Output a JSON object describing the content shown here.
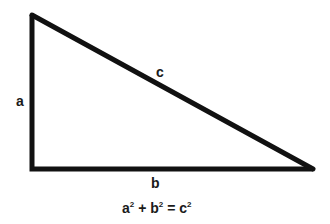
{
  "diagram": {
    "type": "right-triangle",
    "stroke_color": "#111111",
    "vertices": {
      "top_left": [
        32,
        15
      ],
      "bottom_left": [
        32,
        169
      ],
      "bottom_right": [
        313,
        169
      ]
    },
    "labels": {
      "vertical_side": "a",
      "hypotenuse": "c",
      "horizontal_side": "b"
    },
    "formula": {
      "a": "a",
      "a_exp": "2",
      "plus": "+",
      "b": "b",
      "b_exp": "2",
      "equals": "=",
      "c": "c",
      "c_exp": "2"
    }
  }
}
